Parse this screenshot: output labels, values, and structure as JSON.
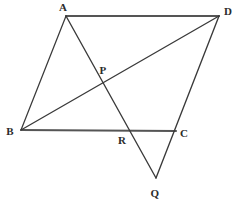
{
  "figure": {
    "kind": "geometry-diagram",
    "background_color": "#ffffff",
    "stroke_color": "#3a3a3a",
    "heavy_stroke_color": "#555555",
    "label_color": "#2b2b2b",
    "canvas": {
      "width": 238,
      "height": 204
    }
  },
  "points": [
    {
      "id": "A",
      "label": "A",
      "x": 66,
      "y": 16,
      "label_x": 63,
      "label_y": 7
    },
    {
      "id": "D",
      "label": "D",
      "x": 219,
      "y": 16,
      "label_x": 228,
      "label_y": 11
    },
    {
      "id": "B",
      "label": "B",
      "x": 21,
      "y": 130,
      "label_x": 10,
      "label_y": 131
    },
    {
      "id": "C",
      "label": "C",
      "x": 176,
      "y": 131,
      "label_x": 184,
      "label_y": 133
    },
    {
      "id": "P",
      "label": "P",
      "x": 105,
      "y": 85,
      "label_x": 103,
      "label_y": 70
    },
    {
      "id": "R",
      "label": "R",
      "x": 125,
      "y": 129,
      "label_x": 122,
      "label_y": 140
    },
    {
      "id": "Q",
      "label": "Q",
      "x": 156,
      "y": 178,
      "label_x": 155,
      "label_y": 193
    }
  ],
  "segments": [
    {
      "id": "AD",
      "from": "A",
      "to": "D",
      "x1": 66,
      "y1": 16,
      "x2": 219,
      "y2": 16,
      "weight": 2.1
    },
    {
      "id": "AB",
      "from": "A",
      "to": "B",
      "x1": 66,
      "y1": 16,
      "x2": 21,
      "y2": 130,
      "weight": 1.25
    },
    {
      "id": "BC",
      "from": "B",
      "to": "C",
      "x1": 21,
      "y1": 130,
      "x2": 176,
      "y2": 131,
      "weight": 2.1
    },
    {
      "id": "BD",
      "from": "B",
      "to": "D",
      "x1": 21,
      "y1": 130,
      "x2": 219,
      "y2": 16,
      "weight": 1.35
    },
    {
      "id": "AQ",
      "from": "A",
      "to": "Q",
      "x1": 66,
      "y1": 16,
      "x2": 156,
      "y2": 178,
      "weight": 1.35
    },
    {
      "id": "DQ",
      "from": "D",
      "to": "Q",
      "x1": 219,
      "y1": 16,
      "x2": 156,
      "y2": 178,
      "weight": 1.35
    }
  ]
}
